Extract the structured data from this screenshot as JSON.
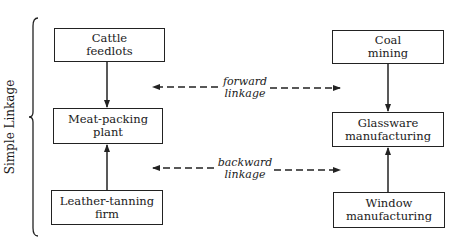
{
  "diagram": {
    "side_label": "Simple Linkage",
    "left_column": {
      "boxes": [
        {
          "id": "cattle",
          "lines": [
            "Cattle",
            "feedlots"
          ]
        },
        {
          "id": "meat",
          "lines": [
            "Meat-packing",
            "plant"
          ]
        },
        {
          "id": "leather",
          "lines": [
            "Leather-tanning",
            "firm"
          ]
        }
      ]
    },
    "right_column": {
      "boxes": [
        {
          "id": "coal",
          "lines": [
            "Coal",
            "mining"
          ]
        },
        {
          "id": "glass",
          "lines": [
            "Glassware",
            "manufacturing"
          ]
        },
        {
          "id": "window",
          "lines": [
            "Window",
            "manufacturing"
          ]
        }
      ]
    },
    "linkages": [
      {
        "name": "forward",
        "lines": [
          "forward",
          "linkage"
        ]
      },
      {
        "name": "backward",
        "lines": [
          "backward",
          "linkage"
        ]
      }
    ],
    "edges": [
      {
        "from": "Cattle feedlots",
        "to": "Meat-packing plant"
      },
      {
        "from": "Leather-tanning firm",
        "to": "Meat-packing plant"
      },
      {
        "from": "Coal mining",
        "to": "Glassware manufacturing"
      },
      {
        "from": "Window manufacturing",
        "to": "Glassware manufacturing"
      }
    ],
    "colors": {
      "stroke": "#222222",
      "background": "#ffffff"
    }
  }
}
